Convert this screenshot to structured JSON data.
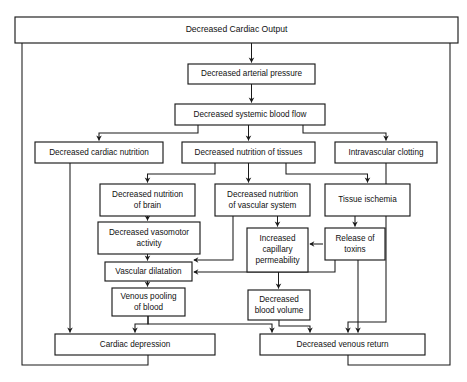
{
  "diagram": {
    "title": "Decreased Cardiac Output",
    "type": "flowchart",
    "orientation": "top-down",
    "colors": {
      "background": "#ffffff",
      "box_stroke": "#1a1a1a",
      "box_fill": "#ffffff",
      "connector": "#1a1a1a",
      "text": "#111111"
    },
    "nodes": [
      {
        "id": "decreased-cardiac-output",
        "lines": [
          "Decreased Cardiac Output"
        ],
        "x": 15,
        "y": 17,
        "w": 443,
        "h": 26,
        "emphasis": "big"
      },
      {
        "id": "decreased-arterial-pressure",
        "lines": [
          "Decreased arterial pressure"
        ],
        "x": 188,
        "y": 64,
        "w": 127,
        "h": 20
      },
      {
        "id": "decreased-systemic-blood-flow",
        "lines": [
          "Decreased systemic blood flow"
        ],
        "x": 175,
        "y": 104,
        "w": 150,
        "h": 21
      },
      {
        "id": "decreased-cardiac-nutrition",
        "lines": [
          "Decreased cardiac nutrition"
        ],
        "x": 35,
        "y": 142,
        "w": 128,
        "h": 21
      },
      {
        "id": "decreased-nutrition-of-tissues",
        "lines": [
          "Decreased nutrition of tissues"
        ],
        "x": 182,
        "y": 142,
        "w": 133,
        "h": 21
      },
      {
        "id": "intravascular-clotting",
        "lines": [
          "Intravascular clotting"
        ],
        "x": 335,
        "y": 142,
        "w": 102,
        "h": 21
      },
      {
        "id": "decreased-nutrition-of-brain",
        "lines": [
          "Decreased nutrition",
          "of brain"
        ],
        "x": 100,
        "y": 184,
        "w": 95,
        "h": 32
      },
      {
        "id": "decreased-nutrition-of-vascular-system",
        "lines": [
          "Decreased nutrition",
          "of vascular system"
        ],
        "x": 215,
        "y": 184,
        "w": 95,
        "h": 32
      },
      {
        "id": "tissue-ischemia",
        "lines": [
          "Tissue ischemia"
        ],
        "x": 325,
        "y": 184,
        "w": 85,
        "h": 32
      },
      {
        "id": "decreased-vasomotor-activity",
        "lines": [
          "Decreased vasomotor",
          "activity"
        ],
        "x": 98,
        "y": 222,
        "w": 102,
        "h": 32
      },
      {
        "id": "increased-capillary-permeability",
        "lines": [
          "Increased",
          "capillary",
          "permeability"
        ],
        "x": 247,
        "y": 228,
        "w": 61,
        "h": 44
      },
      {
        "id": "release-of-toxins",
        "lines": [
          "Release of",
          "toxins"
        ],
        "x": 325,
        "y": 228,
        "w": 60,
        "h": 32
      },
      {
        "id": "vascular-dilatation",
        "lines": [
          "Vascular dilatation"
        ],
        "x": 105,
        "y": 262,
        "w": 87,
        "h": 19
      },
      {
        "id": "venous-pooling-of-blood",
        "lines": [
          "Venous pooling",
          "of blood"
        ],
        "x": 112,
        "y": 288,
        "w": 73,
        "h": 28
      },
      {
        "id": "decreased-blood-volume",
        "lines": [
          "Decreased",
          "blood volume"
        ],
        "x": 248,
        "y": 290,
        "w": 62,
        "h": 30
      },
      {
        "id": "cardiac-depression",
        "lines": [
          "Cardiac depression"
        ],
        "x": 55,
        "y": 334,
        "w": 160,
        "h": 21
      },
      {
        "id": "decreased-venous-return",
        "lines": [
          "Decreased venous return"
        ],
        "x": 260,
        "y": 334,
        "w": 165,
        "h": 21
      }
    ],
    "edges": [
      {
        "from": "decreased-cardiac-output",
        "to": "decreased-arterial-pressure",
        "path": "M 251.5 43 L 251.5 62.5",
        "arrow": true
      },
      {
        "from": "decreased-arterial-pressure",
        "to": "decreased-systemic-blood-flow",
        "path": "M 251.5 84 L 251.5 102.5",
        "arrow": true
      },
      {
        "from": "decreased-systemic-blood-flow",
        "to": "decreased-cardiac-nutrition",
        "path": "M 198 125 L 198 133 L 99 133 L 99 140.5",
        "arrow": true
      },
      {
        "from": "decreased-systemic-blood-flow",
        "to": "decreased-nutrition-of-tissues",
        "path": "M 248.5 125 L 248.5 140.5",
        "arrow": true
      },
      {
        "from": "decreased-systemic-blood-flow",
        "to": "intravascular-clotting",
        "path": "M 303 125 L 303 133 L 386 133 L 386 140.5",
        "arrow": true
      },
      {
        "from": "decreased-nutrition-of-tissues",
        "to": "decreased-nutrition-of-brain",
        "path": "M 215 163 L 215 174 L 147.5 174 L 147.5 182.5",
        "arrow": true
      },
      {
        "from": "decreased-nutrition-of-tissues",
        "to": "decreased-nutrition-of-vascular-system",
        "path": "M 248.5 163 L 248.5 182.5",
        "arrow": true
      },
      {
        "from": "decreased-nutrition-of-tissues",
        "to": "tissue-ischemia",
        "path": "M 286 163 L 286 174 L 367.5 174 L 367.5 182.5",
        "arrow": true
      },
      {
        "from": "decreased-nutrition-of-brain",
        "to": "decreased-vasomotor-activity",
        "path": "M 147.5 216 L 147.5 220.5",
        "arrow": true
      },
      {
        "from": "decreased-nutrition-of-vascular-system",
        "to": "vascular-dilatation",
        "path": "M 233 216 L 233 260 L 194 260",
        "arrow": true,
        "arrow_dir": "left"
      },
      {
        "from": "decreased-nutrition-of-vascular-system",
        "to": "increased-capillary-permeability",
        "path": "M 277.5 216 L 277.5 226.5",
        "arrow": true
      },
      {
        "from": "tissue-ischemia",
        "to": "release-of-toxins",
        "path": "M 355 216 L 355 226.5",
        "arrow": true
      },
      {
        "from": "release-of-toxins",
        "to": "increased-capillary-permeability",
        "path": "M 323 244 L 310 244",
        "arrow": true,
        "arrow_dir": "left"
      },
      {
        "from": "decreased-vasomotor-activity",
        "to": "vascular-dilatation",
        "path": "M 147.5 254 L 147.5 260.5",
        "arrow": true
      },
      {
        "from": "release-of-toxins",
        "to": "vascular-dilatation",
        "path": "M 335 260 L 335 272 L 194 272",
        "arrow": true,
        "arrow_dir": "left"
      },
      {
        "from": "vascular-dilatation",
        "to": "venous-pooling-of-blood",
        "path": "M 147.5 281 L 147.5 286.5",
        "arrow": true
      },
      {
        "from": "increased-capillary-permeability",
        "to": "decreased-blood-volume",
        "path": "M 278.5 272 L 278.5 288.5",
        "arrow": true
      },
      {
        "from": "venous-pooling-of-blood",
        "to": "cardiac-depression",
        "path": "M 148 316 L 148 324 L 135 324 L 135 332.5",
        "arrow": true
      },
      {
        "from": "venous-pooling-of-blood",
        "to": "decreased-venous-return",
        "path": "M 148 316 L 148 324 L 272 324 L 272 332.5",
        "arrow": true
      },
      {
        "from": "decreased-blood-volume",
        "to": "decreased-venous-return",
        "path": "M 279 320 L 279 326 L 310 326 L 310 332.5",
        "arrow": true
      },
      {
        "from": "intravascular-clotting",
        "to": "decreased-venous-return",
        "path": "M 386 163 L 386 322 L 348 322 L 348 332.5",
        "arrow": true
      },
      {
        "from": "release-of-toxins",
        "to": "decreased-venous-return",
        "path": "M 358 260 L 358 332.5",
        "arrow": true
      },
      {
        "from": "decreased-cardiac-nutrition",
        "to": "cardiac-depression",
        "path": "M 70 163 L 70 332.5",
        "arrow": true
      },
      {
        "from": "cardiac-depression",
        "to": "decreased-cardiac-output",
        "path": "M 148 355 L 148 365 L 22 365 L 22 31 L 29 31",
        "arrow": true,
        "arrow_dir": "up",
        "arrow_at": "M 29 31"
      },
      {
        "from": "decreased-venous-return",
        "to": "decreased-cardiac-output",
        "path": "M 348 355 L 348 365 L 450 365 L 450 31 L 443 31",
        "arrow": true,
        "arrow_dir": "up",
        "arrow_at": "M 443 31"
      }
    ],
    "frame": {
      "left_return_x": 22,
      "right_return_x": 450,
      "bottom_y": 365,
      "top_y": 31
    }
  }
}
